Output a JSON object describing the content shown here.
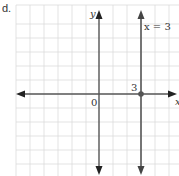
{
  "problem_label": "d.",
  "graph": {
    "axes": {
      "x_label": "x",
      "y_label": "y",
      "origin_label": "0"
    },
    "line": {
      "equation_label": "x = 3",
      "x_value": 3
    },
    "point": {
      "label": "3",
      "x": 3,
      "y": 0
    },
    "grid": {
      "x_min": -6,
      "x_max": 5,
      "y_min": -6,
      "y_max": 6
    },
    "colors": {
      "grid": "#dcdcdc",
      "axis": "#555555",
      "line": "#666666",
      "text": "#333333"
    }
  }
}
